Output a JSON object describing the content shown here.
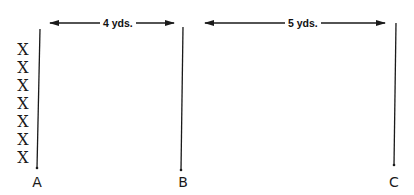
{
  "diagram": {
    "players": {
      "symbol": "X",
      "count": 7,
      "items": [
        "X",
        "X",
        "X",
        "X",
        "X",
        "X",
        "X"
      ]
    },
    "cones": [
      {
        "label": "A"
      },
      {
        "label": "B"
      },
      {
        "label": "C"
      }
    ],
    "distances": [
      {
        "from": "A",
        "to": "B",
        "label": "4 yds."
      },
      {
        "from": "B",
        "to": "C",
        "label": "5 yds."
      }
    ],
    "colors": {
      "ink": "#1a1a1a",
      "background": "#ffffff"
    }
  }
}
